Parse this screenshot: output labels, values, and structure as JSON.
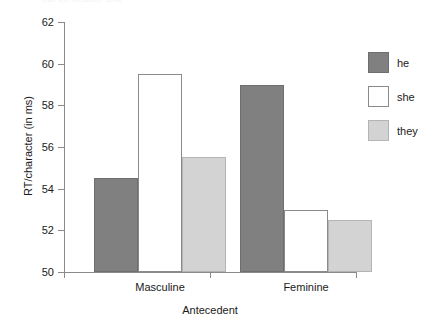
{
  "chart_data": {
    "type": "bar",
    "title": "",
    "subtitle": "",
    "xlabel": "Antecedent",
    "ylabel": "RT/character (in ms)",
    "categories": [
      "Masculine",
      "Feminine"
    ],
    "series": [
      {
        "name": "he",
        "values": [
          54.5,
          59.0
        ],
        "color": "#808080"
      },
      {
        "name": "she",
        "values": [
          59.5,
          53.0
        ],
        "color": "#ffffff"
      },
      {
        "name": "they",
        "values": [
          55.5,
          52.5
        ],
        "color": "#d3d3d3"
      }
    ],
    "ylim": [
      50,
      62
    ],
    "yticks": [
      50,
      52,
      54,
      56,
      58,
      60,
      62
    ],
    "ytick_labels": [
      "50",
      "52",
      "54",
      "56",
      "58",
      "60",
      "62"
    ],
    "grid": false,
    "legend_position": "right",
    "bar_gap_within_group": 0,
    "colors": {
      "dark_gray": "#808080",
      "white": "#ffffff",
      "light_gray": "#d3d3d3",
      "axis": "#8a8a8a",
      "text": "#1a1a1a",
      "background": "#ffffff"
    }
  },
  "artifact": {
    "top_edge_text": "cut off header text"
  }
}
